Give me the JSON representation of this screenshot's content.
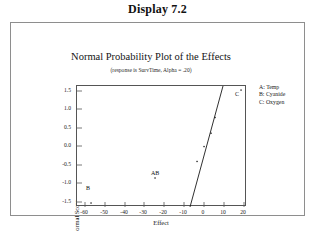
{
  "caption": "Display 7.2",
  "chart_title": "Normal Probability Plot of the Effects",
  "chart_subtitle": "(response is SurvTime, Alpha = .20)",
  "legend": {
    "rows": [
      "A:  Temp",
      "B:  Cyanide",
      "C:  Oxygen"
    ]
  },
  "axes": {
    "xlabel": "Effect",
    "ylabel": "Normal Score",
    "xticks": [
      "-60",
      "-50",
      "-40",
      "-30",
      "-20",
      "-10",
      "0",
      "10",
      "20"
    ],
    "yticks": [
      "1.5",
      "1.0",
      "0.5",
      "0.0",
      "-0.5",
      "-1.0",
      "-1.5"
    ]
  },
  "point_labels": {
    "b": "B",
    "ab": "AB",
    "c": "C"
  },
  "chart_data": {
    "type": "scatter",
    "title": "Normal Probability Plot of the Effects",
    "subtitle": "(response is SurvTime, Alpha = .20)",
    "xlabel": "Effect",
    "ylabel": "Normal Score",
    "xlim": [
      -65,
      20
    ],
    "ylim": [
      -1.5,
      1.5
    ],
    "xticks": [
      -60,
      -50,
      -40,
      -30,
      -20,
      -10,
      0,
      10,
      20
    ],
    "yticks": [
      1.5,
      1.0,
      0.5,
      0.0,
      -0.5,
      -1.0,
      -1.5
    ],
    "grid": false,
    "legend_position": "right-outside",
    "legend_entries": [
      "A:  Temp",
      "B:  Cyanide",
      "C:  Oxygen"
    ],
    "points": [
      {
        "x": -58.0,
        "y": -1.4,
        "label": "B"
      },
      {
        "x": -26.0,
        "y": -0.78,
        "label": "AB"
      },
      {
        "x": -5.0,
        "y": -0.37,
        "label": ""
      },
      {
        "x": -1.5,
        "y": 0.0,
        "label": ""
      },
      {
        "x": 2.0,
        "y": 0.33,
        "label": ""
      },
      {
        "x": 4.0,
        "y": 0.72,
        "label": ""
      },
      {
        "x": 17.0,
        "y": 1.4,
        "label": "C"
      }
    ],
    "reference_line": {
      "x0": -8.5,
      "y0": -1.5,
      "x1": 8.0,
      "y1": 1.5
    }
  }
}
